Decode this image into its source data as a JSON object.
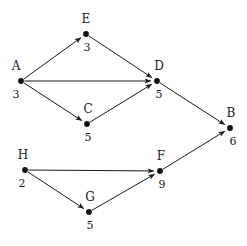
{
  "diagram": {
    "type": "directed-graph",
    "title": "",
    "width": 247,
    "height": 246,
    "background_color": "#ffffff",
    "node_color": "#111111",
    "edge_color": "#1a1a1a",
    "text_color": "#1a1a1a",
    "nodes": [
      {
        "id": "A",
        "label": "A",
        "value": "3",
        "x": 21,
        "y": 81,
        "label_dx": -5,
        "label_dy": -11,
        "value_dx": -5,
        "value_dy": 17
      },
      {
        "id": "E",
        "label": "E",
        "value": "3",
        "x": 86,
        "y": 34,
        "label_dx": 0,
        "label_dy": -11,
        "value_dx": 1,
        "value_dy": 17
      },
      {
        "id": "C",
        "label": "C",
        "value": "5",
        "x": 87,
        "y": 124,
        "label_dx": 1,
        "label_dy": -11,
        "value_dx": 1,
        "value_dy": 17
      },
      {
        "id": "D",
        "label": "D",
        "value": "5",
        "x": 157,
        "y": 81,
        "label_dx": 2,
        "label_dy": -11,
        "value_dx": 2,
        "value_dy": 17
      },
      {
        "id": "B",
        "label": "B",
        "value": "6",
        "x": 230,
        "y": 128,
        "label_dx": 1,
        "label_dy": -11,
        "value_dx": 3,
        "value_dy": 17
      },
      {
        "id": "H",
        "label": "H",
        "value": "2",
        "x": 25,
        "y": 170,
        "label_dx": -2,
        "label_dy": -11,
        "value_dx": -3,
        "value_dy": 17
      },
      {
        "id": "G",
        "label": "G",
        "value": "5",
        "x": 89,
        "y": 212,
        "label_dx": 1,
        "label_dy": -11,
        "value_dx": 1,
        "value_dy": 17
      },
      {
        "id": "F",
        "label": "F",
        "value": "9",
        "x": 160,
        "y": 171,
        "label_dx": 1,
        "label_dy": -11,
        "value_dx": 2,
        "value_dy": 17
      }
    ],
    "edges": [
      {
        "from": "A",
        "to": "E",
        "directed": true
      },
      {
        "from": "A",
        "to": "D",
        "directed": true
      },
      {
        "from": "A",
        "to": "C",
        "directed": true
      },
      {
        "from": "E",
        "to": "D",
        "directed": true
      },
      {
        "from": "C",
        "to": "D",
        "directed": true
      },
      {
        "from": "D",
        "to": "B",
        "directed": true
      },
      {
        "from": "H",
        "to": "F",
        "directed": true
      },
      {
        "from": "H",
        "to": "G",
        "directed": true
      },
      {
        "from": "G",
        "to": "F",
        "directed": true
      },
      {
        "from": "F",
        "to": "B",
        "directed": true
      }
    ]
  }
}
